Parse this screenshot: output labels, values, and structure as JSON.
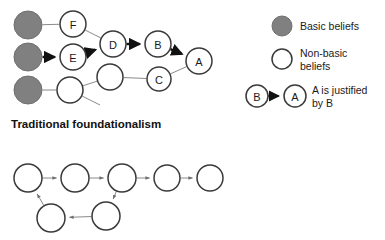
{
  "figure": {
    "background": "#ffffff",
    "stroke_thin": "#8a8a8a",
    "stroke_node": "#3a3a3a",
    "stroke_bold": "#111111",
    "basic_fill": "#808080",
    "nonbasic_fill": "#ffffff"
  },
  "caption": {
    "text": "Traditional foundationalism"
  },
  "top_diagram": {
    "name": "traditional-foundationalism-diagram",
    "nodes": [
      {
        "id": "basic1",
        "label": "",
        "x": 28,
        "y": 25,
        "r": 14,
        "kind": "basic"
      },
      {
        "id": "basic2",
        "label": "",
        "x": 28,
        "y": 57,
        "r": 14,
        "kind": "basic"
      },
      {
        "id": "basic3",
        "label": "",
        "x": 28,
        "y": 90,
        "r": 14,
        "kind": "basic"
      },
      {
        "id": "F",
        "label": "F",
        "x": 73,
        "y": 24,
        "r": 13,
        "kind": "nonbasic"
      },
      {
        "id": "E",
        "label": "E",
        "x": 73,
        "y": 57,
        "r": 13,
        "kind": "nonbasic"
      },
      {
        "id": "N1",
        "label": "",
        "x": 70,
        "y": 90,
        "r": 13,
        "kind": "nonbasic"
      },
      {
        "id": "D",
        "label": "D",
        "x": 113,
        "y": 44,
        "r": 13,
        "kind": "nonbasic"
      },
      {
        "id": "N2",
        "label": "",
        "x": 110,
        "y": 77,
        "r": 13,
        "kind": "nonbasic"
      },
      {
        "id": "B",
        "label": "B",
        "x": 158,
        "y": 44,
        "r": 13,
        "kind": "nonbasic"
      },
      {
        "id": "C",
        "label": "C",
        "x": 159,
        "y": 79,
        "r": 12,
        "kind": "nonbasic"
      },
      {
        "id": "A",
        "label": "A",
        "x": 199,
        "y": 61,
        "r": 13,
        "kind": "nonbasic"
      }
    ],
    "edges": [
      {
        "from": "basic1",
        "to": "F",
        "style": "thin",
        "arrow": false
      },
      {
        "from": "F",
        "to": "D",
        "style": "thin",
        "arrow": false
      },
      {
        "from": "basic2",
        "to": "E",
        "style": "bold",
        "arrow": true
      },
      {
        "from": "E",
        "to": "D",
        "style": "bold",
        "arrow": true
      },
      {
        "from": "D",
        "to": "B",
        "style": "bold",
        "arrow": true
      },
      {
        "from": "B",
        "to": "A",
        "style": "bold",
        "arrow": true
      },
      {
        "from": "basic3",
        "to": "N1",
        "style": "thin",
        "arrow": false
      },
      {
        "from": "N1",
        "to": "N2",
        "style": "thin",
        "arrow": false
      },
      {
        "from": "N2",
        "to": "C",
        "style": "thin",
        "arrow": false
      },
      {
        "from": "C",
        "to": "A",
        "style": "thin",
        "arrow": false
      }
    ],
    "stubs": [
      {
        "x1": 80,
        "y1": 95,
        "x2": 100,
        "y2": 105
      }
    ]
  },
  "bottom_diagram": {
    "name": "coherentism-diagram",
    "nodes": [
      {
        "id": "c1",
        "label": "",
        "x": 28,
        "y": 178,
        "r": 14,
        "kind": "nonbasic"
      },
      {
        "id": "c2",
        "label": "",
        "x": 75,
        "y": 178,
        "r": 14,
        "kind": "nonbasic"
      },
      {
        "id": "c3",
        "label": "",
        "x": 122,
        "y": 178,
        "r": 14,
        "kind": "nonbasic"
      },
      {
        "id": "c4",
        "label": "",
        "x": 167,
        "y": 178,
        "r": 13,
        "kind": "nonbasic"
      },
      {
        "id": "c5",
        "label": "",
        "x": 210,
        "y": 178,
        "r": 13,
        "kind": "nonbasic"
      },
      {
        "id": "c6",
        "label": "",
        "x": 106,
        "y": 216,
        "r": 14,
        "kind": "nonbasic"
      },
      {
        "id": "c7",
        "label": "",
        "x": 51,
        "y": 218,
        "r": 14,
        "kind": "nonbasic"
      }
    ],
    "edges": [
      {
        "from": "c1",
        "to": "c2",
        "style": "thin",
        "arrow": true
      },
      {
        "from": "c2",
        "to": "c3",
        "style": "thin",
        "arrow": true
      },
      {
        "from": "c3",
        "to": "c4",
        "style": "thin",
        "arrow": true
      },
      {
        "from": "c4",
        "to": "c5",
        "style": "thin",
        "arrow": true
      },
      {
        "from": "c3",
        "to": "c6",
        "style": "thin",
        "arrow": true
      },
      {
        "from": "c6",
        "to": "c7",
        "style": "thin",
        "arrow": true
      },
      {
        "from": "c7",
        "to": "c1",
        "style": "thin",
        "arrow": true
      }
    ],
    "stubs": []
  },
  "legend": {
    "name": "legend",
    "items": [
      {
        "id": "basic",
        "swatch": "circle-filled",
        "lines": [
          "Basic beliefs"
        ],
        "cx": 282,
        "cy": 26,
        "r": 10,
        "text_x": 300,
        "text_y": 26
      },
      {
        "id": "nonbasic",
        "swatch": "circle-open",
        "lines": [
          "Non-basic",
          "beliefs"
        ],
        "cx": 282,
        "cy": 59,
        "r": 10,
        "text_x": 300,
        "text_y": 53
      },
      {
        "id": "justification",
        "swatch": "arrow-pair",
        "lines": [
          "A is justified",
          "by B"
        ],
        "from_label": "B",
        "to_label": "A",
        "from_x": 257,
        "from_y": 96,
        "to_x": 295,
        "to_y": 96,
        "r": 11,
        "text_x": 312,
        "text_y": 90
      }
    ]
  }
}
